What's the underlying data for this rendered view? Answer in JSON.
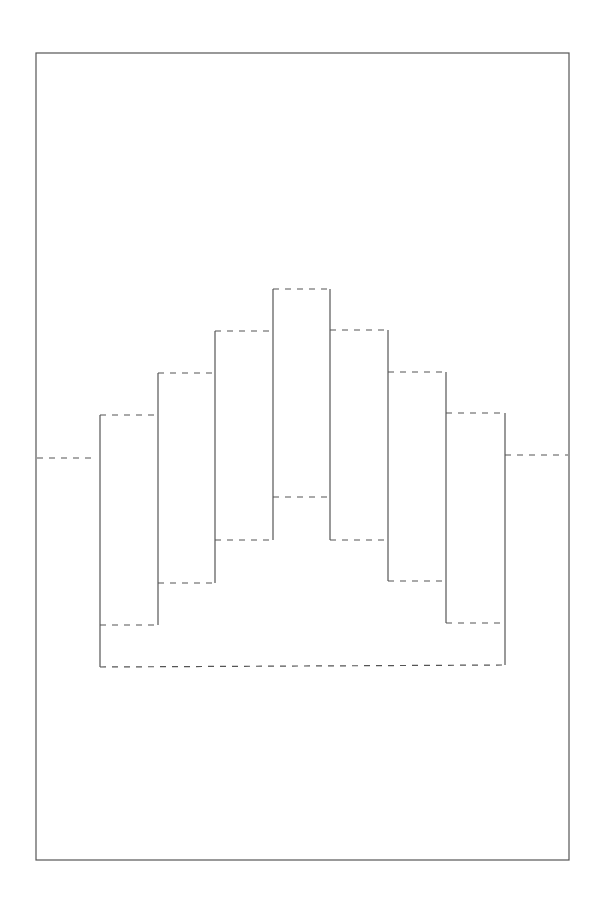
{
  "diagram": {
    "type": "pop-up card template",
    "colors": {
      "line": "#555555",
      "background": "#ffffff"
    },
    "border": {
      "x": 36,
      "y": 53,
      "width": 533,
      "height": 807
    },
    "solid_lines": [
      [
        100,
        415,
        100,
        667
      ],
      [
        158,
        373,
        158,
        625
      ],
      [
        215,
        331,
        215,
        583
      ],
      [
        273,
        289,
        273,
        540
      ],
      [
        330,
        289,
        330,
        540
      ],
      [
        388,
        330,
        388,
        581
      ],
      [
        446,
        372,
        446,
        623
      ],
      [
        505,
        413,
        505,
        665
      ]
    ],
    "dashed_lines": [
      [
        37,
        458,
        95,
        458
      ],
      [
        100,
        415,
        158,
        415
      ],
      [
        158,
        373,
        215,
        373
      ],
      [
        215,
        331,
        273,
        331
      ],
      [
        273,
        289,
        330,
        289
      ],
      [
        330,
        330,
        388,
        330
      ],
      [
        388,
        372,
        446,
        372
      ],
      [
        446,
        413,
        505,
        413
      ],
      [
        505,
        455,
        568,
        455
      ],
      [
        100,
        625,
        158,
        625
      ],
      [
        158,
        583,
        215,
        583
      ],
      [
        215,
        540,
        273,
        540
      ],
      [
        273,
        497,
        330,
        497
      ],
      [
        330,
        540,
        388,
        540
      ],
      [
        388,
        581,
        446,
        581
      ],
      [
        446,
        623,
        505,
        623
      ],
      [
        100,
        667,
        505,
        665
      ]
    ],
    "legend": {
      "solid": "cut line",
      "dashed": "fold line"
    }
  }
}
